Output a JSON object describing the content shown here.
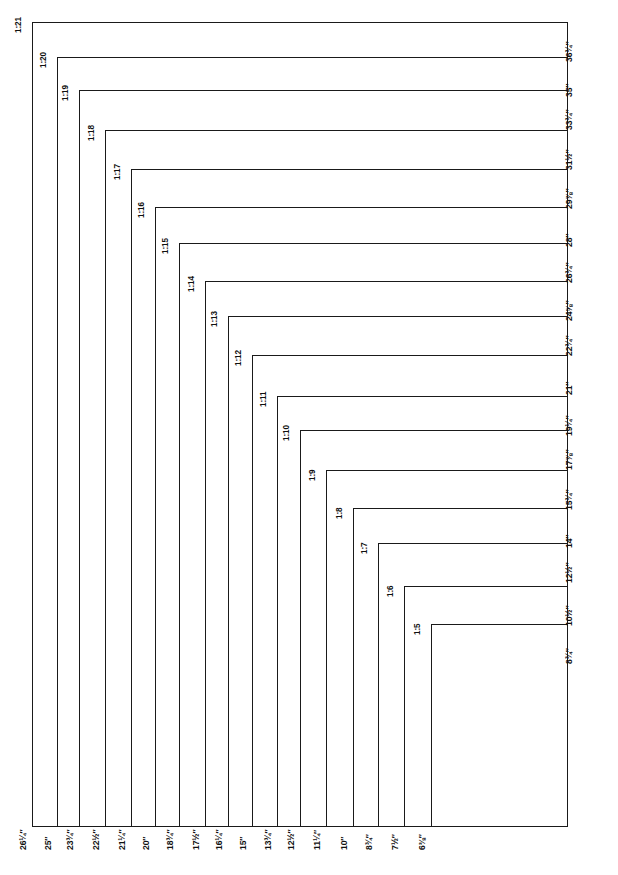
{
  "diagram": {
    "line_color": "#1a1a1a",
    "background_color": "#ffffff",
    "shared_corner": "bottom-right",
    "unit": "inches",
    "rect_count": 17
  },
  "rectangles": [
    {
      "ratio": "1:21",
      "height": "36¾″",
      "width": "26¼″",
      "left": 32,
      "top": 22
    },
    {
      "ratio": "1:20",
      "height": "35″",
      "width": "25″",
      "left": 57,
      "top": 57
    },
    {
      "ratio": "1:19",
      "height": "33¾″",
      "width": "23¾″",
      "left": 79,
      "top": 90
    },
    {
      "ratio": "1:18",
      "height": "31½″",
      "width": "22½″",
      "left": 105,
      "top": 130
    },
    {
      "ratio": "1:17",
      "height": "29⅞″",
      "width": "21¼″",
      "left": 131,
      "top": 169
    },
    {
      "ratio": "1:16",
      "height": "28″",
      "width": "20″",
      "left": 155,
      "top": 207
    },
    {
      "ratio": "1:15",
      "height": "26¾″",
      "width": "18¾″",
      "left": 179,
      "top": 243
    },
    {
      "ratio": "1:14",
      "height": "24⅝″",
      "width": "17½″",
      "left": 205,
      "top": 281
    },
    {
      "ratio": "1:13",
      "height": "22¾″",
      "width": "16¼″",
      "left": 228,
      "top": 316
    },
    {
      "ratio": "1:12",
      "height": "21″",
      "width": "15″",
      "left": 252,
      "top": 355
    },
    {
      "ratio": "1:11",
      "height": "19¼″",
      "width": "13¾″",
      "left": 277,
      "top": 396
    },
    {
      "ratio": "1:10",
      "height": "17⅞″",
      "width": "12½″",
      "left": 300,
      "top": 430
    },
    {
      "ratio": "1:9",
      "height": "15¾″",
      "width": "11¼″",
      "left": 326,
      "top": 470
    },
    {
      "ratio": "1:8",
      "height": "14″",
      "width": "10″",
      "left": 353,
      "top": 508
    },
    {
      "ratio": "1:7",
      "height": "12½″",
      "width": "8¾″",
      "left": 378,
      "top": 543
    },
    {
      "ratio": "1:6",
      "height": "10½″",
      "width": "7½″",
      "left": 404,
      "top": 586
    },
    {
      "ratio": "1:5",
      "height": "8¾″",
      "width": "6⅜″",
      "left": 431,
      "top": 624
    }
  ],
  "frame": {
    "right_edge_x": 568,
    "bottom_edge_y": 827
  }
}
